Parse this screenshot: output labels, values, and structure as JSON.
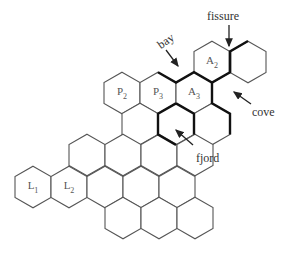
{
  "diagram": {
    "hex": {
      "w": 36,
      "r": 20.8,
      "stroke": "#555555",
      "bold_stroke": "#111111"
    },
    "cells": [
      {
        "cx": 212,
        "cy": 62,
        "label": "A",
        "sub": "2"
      },
      {
        "cx": 248,
        "cy": 62,
        "label": "",
        "sub": ""
      },
      {
        "cx": 122,
        "cy": 93,
        "label": "P",
        "sub": "2"
      },
      {
        "cx": 158,
        "cy": 93,
        "label": "P",
        "sub": "3"
      },
      {
        "cx": 194,
        "cy": 93,
        "label": "A",
        "sub": "3"
      },
      {
        "cx": 140,
        "cy": 124,
        "label": "",
        "sub": ""
      },
      {
        "cx": 176,
        "cy": 124,
        "label": "",
        "sub": ""
      },
      {
        "cx": 212,
        "cy": 124,
        "label": "",
        "sub": ""
      },
      {
        "cx": 87,
        "cy": 155,
        "label": "",
        "sub": ""
      },
      {
        "cx": 123,
        "cy": 155,
        "label": "",
        "sub": ""
      },
      {
        "cx": 159,
        "cy": 155,
        "label": "",
        "sub": ""
      },
      {
        "cx": 195,
        "cy": 155,
        "label": "",
        "sub": ""
      },
      {
        "cx": 33,
        "cy": 187,
        "label": "L",
        "sub": "1"
      },
      {
        "cx": 69,
        "cy": 187,
        "label": "L",
        "sub": "2"
      },
      {
        "cx": 105,
        "cy": 187,
        "label": "",
        "sub": ""
      },
      {
        "cx": 141,
        "cy": 187,
        "label": "",
        "sub": ""
      },
      {
        "cx": 177,
        "cy": 187,
        "label": "",
        "sub": ""
      },
      {
        "cx": 123,
        "cy": 218,
        "label": "",
        "sub": ""
      },
      {
        "cx": 159,
        "cy": 218,
        "label": "",
        "sub": ""
      },
      {
        "cx": 195,
        "cy": 218,
        "label": "",
        "sub": ""
      }
    ],
    "bold_paths": [
      "M158,72.2 L176,82.6 L194,72.2 L212,82.6 L230,72.2 L230,51.4 L248,41",
      "M230,51.4 L230,72.2",
      "M212,82.6 L212,103.4 L230,113.8 L230,134.6",
      "M176,103.4 L194,113.8 L194,134.6",
      "M176,103.4 L158,113.8 L158,134.6 L176,145"
    ],
    "annotations": [
      {
        "text": "fissure",
        "x": 207,
        "y": 10
      },
      {
        "text": "bay",
        "x": 157,
        "y": 35
      },
      {
        "text": "cove",
        "x": 252,
        "y": 106
      },
      {
        "text": "fjord",
        "x": 196,
        "y": 152
      }
    ],
    "arrows": [
      {
        "name": "fissure-arrow",
        "x1": 229,
        "y1": 25,
        "x2": 229,
        "y2": 46
      },
      {
        "name": "bay-arrow",
        "x1": 166,
        "y1": 50,
        "x2": 178,
        "y2": 66
      },
      {
        "name": "cove-arrow",
        "x1": 251,
        "y1": 104,
        "x2": 234,
        "y2": 92
      },
      {
        "name": "fjord-arrow",
        "x1": 193,
        "y1": 145,
        "x2": 176,
        "y2": 130
      }
    ]
  }
}
